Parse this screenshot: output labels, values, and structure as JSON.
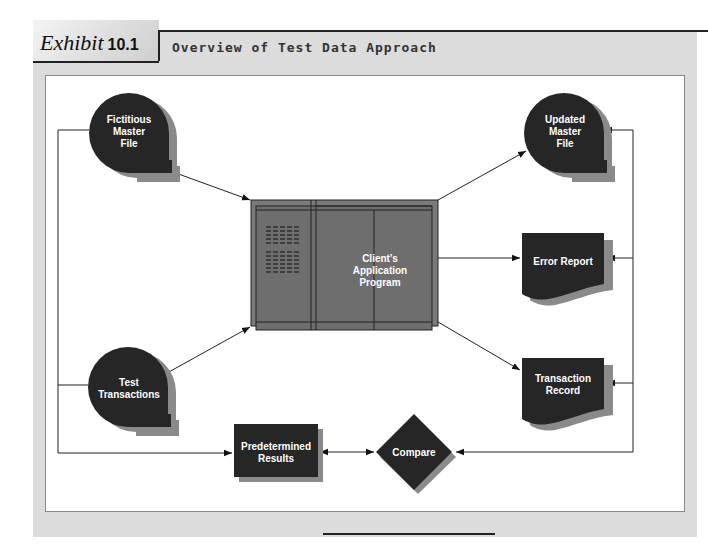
{
  "header": {
    "exhibit_word": "Exhibit",
    "exhibit_number": "10.1",
    "title": "Overview of Test Data Approach"
  },
  "nodes": {
    "fictitious_master_file": {
      "line1": "Fictitious",
      "line2": "Master",
      "line3": "File",
      "shape": "magnetic-tape"
    },
    "updated_master_file": {
      "line1": "Updated",
      "line2": "Master",
      "line3": "File",
      "shape": "magnetic-tape"
    },
    "test_transactions": {
      "line1": "Test",
      "line2": "Transactions",
      "shape": "magnetic-tape"
    },
    "client_program": {
      "line1": "Client's",
      "line2": "Application",
      "line3": "Program",
      "shape": "computer"
    },
    "error_report": {
      "line1": "Error Report",
      "shape": "document"
    },
    "transaction_record": {
      "line1": "Transaction",
      "line2": "Record",
      "shape": "document"
    },
    "predetermined_results": {
      "line1": "Predetermined",
      "line2": "Results",
      "shape": "rectangle"
    },
    "compare": {
      "line1": "Compare",
      "shape": "diamond"
    }
  },
  "edges": [
    {
      "from": "fictitious_master_file",
      "to": "client_program"
    },
    {
      "from": "test_transactions",
      "to": "client_program"
    },
    {
      "from": "client_program",
      "to": "updated_master_file"
    },
    {
      "from": "client_program",
      "to": "error_report"
    },
    {
      "from": "client_program",
      "to": "transaction_record"
    },
    {
      "from": "fictitious_master_file",
      "to": "predetermined_results"
    },
    {
      "from": "test_transactions",
      "to": "predetermined_results"
    },
    {
      "from": "predetermined_results",
      "to": "compare",
      "bidirectional": true
    },
    {
      "from": "right_bus",
      "to": "updated_master_file"
    },
    {
      "from": "right_bus",
      "to": "error_report"
    },
    {
      "from": "right_bus",
      "to": "transaction_record"
    },
    {
      "from": "right_bus",
      "to": "compare"
    }
  ],
  "colors": {
    "node_fill": "#262626",
    "node_shadow": "#8a8a8a",
    "computer_fill": "#7a7a7a",
    "frame": "#dcdcdc",
    "line": "#222222"
  }
}
